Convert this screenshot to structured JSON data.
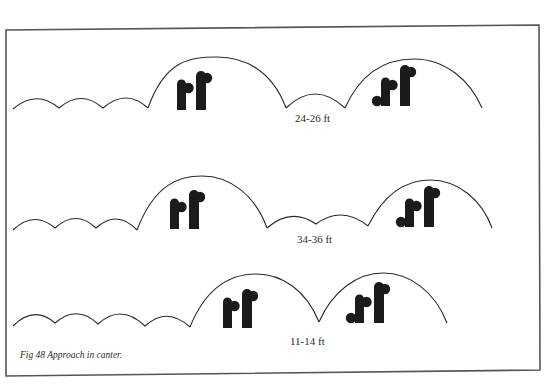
{
  "figure": {
    "caption": "Fig 48  Approach in canter.",
    "colors": {
      "ink": "#1b1b1b",
      "frame": "#555555",
      "background": "#ffffff"
    },
    "rows": [
      {
        "id": "row-1",
        "approach_strides": 3,
        "distance_label": "24-26 ft",
        "between_fence_strides": 1,
        "fences": [
          "vertical-jump-icon",
          "spread-jump-icon"
        ]
      },
      {
        "id": "row-2",
        "approach_strides": 3,
        "distance_label": "34-36 ft",
        "between_fence_strides": 2,
        "fences": [
          "vertical-jump-icon",
          "spread-jump-icon"
        ]
      },
      {
        "id": "row-3",
        "approach_strides": 4,
        "distance_label": "11-14 ft",
        "between_fence_strides": 0,
        "fences": [
          "vertical-jump-icon",
          "spread-jump-icon"
        ]
      }
    ]
  }
}
